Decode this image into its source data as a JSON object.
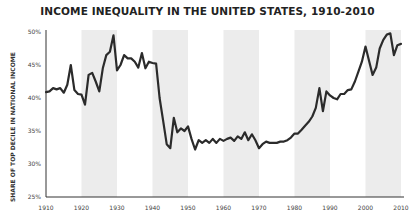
{
  "chart_data": {
    "type": "line",
    "title": "INCOME INEQUALITY IN THE UNITED STATES, 1910-2010",
    "xlabel": "",
    "ylabel": "SHARE OF TOP DECILE IN NATIONAL INCOME",
    "ylim": [
      25,
      50
    ],
    "xlim": [
      1910,
      2010
    ],
    "grid": false,
    "legend": null,
    "y_ticks": [
      "25%",
      "30%",
      "35%",
      "40%",
      "45%",
      "50%"
    ],
    "x_ticks": [
      "1910",
      "1920",
      "1930",
      "1940",
      "1950",
      "1960",
      "1970",
      "1980",
      "1990",
      "2000",
      "2010"
    ],
    "shaded_bands": [
      [
        1920,
        1930
      ],
      [
        1940,
        1950
      ],
      [
        1960,
        1970
      ],
      [
        1980,
        1990
      ],
      [
        2000,
        2010
      ]
    ],
    "series": [
      {
        "name": "Top decile share",
        "color": "#2b2b2b",
        "x": [
          1910,
          1911,
          1912,
          1913,
          1914,
          1915,
          1916,
          1917,
          1918,
          1919,
          1920,
          1921,
          1922,
          1923,
          1924,
          1925,
          1926,
          1927,
          1928,
          1929,
          1930,
          1931,
          1932,
          1933,
          1934,
          1935,
          1936,
          1937,
          1938,
          1939,
          1940,
          1941,
          1942,
          1943,
          1944,
          1945,
          1946,
          1947,
          1948,
          1949,
          1950,
          1951,
          1952,
          1953,
          1954,
          1955,
          1956,
          1957,
          1958,
          1959,
          1960,
          1961,
          1962,
          1963,
          1964,
          1965,
          1966,
          1967,
          1968,
          1969,
          1970,
          1971,
          1972,
          1973,
          1974,
          1975,
          1976,
          1977,
          1978,
          1979,
          1980,
          1981,
          1982,
          1983,
          1984,
          1985,
          1986,
          1987,
          1988,
          1989,
          1990,
          1991,
          1992,
          1993,
          1994,
          1995,
          1996,
          1997,
          1998,
          1999,
          2000,
          2001,
          2002,
          2003,
          2004,
          2005,
          2006,
          2007,
          2008,
          2009,
          2010
        ],
        "values": [
          40.9,
          41.0,
          41.5,
          41.3,
          41.5,
          40.8,
          42.0,
          45.0,
          41.2,
          40.6,
          40.5,
          39.0,
          43.5,
          43.8,
          42.5,
          41.0,
          44.5,
          46.5,
          47.0,
          49.5,
          44.2,
          45.0,
          46.5,
          46.0,
          46.0,
          45.5,
          44.6,
          46.8,
          44.5,
          45.5,
          45.3,
          45.2,
          40.0,
          36.5,
          33.0,
          32.4,
          37.0,
          34.8,
          35.4,
          35.0,
          35.7,
          33.8,
          32.2,
          33.6,
          33.2,
          33.6,
          33.2,
          33.8,
          33.2,
          33.8,
          33.5,
          33.8,
          34.0,
          33.5,
          34.2,
          33.8,
          34.8,
          33.6,
          34.5,
          33.6,
          32.4,
          33.0,
          33.4,
          33.2,
          33.2,
          33.2,
          33.4,
          33.4,
          33.6,
          34.0,
          34.6,
          34.6,
          35.2,
          35.8,
          36.4,
          37.2,
          38.5,
          41.5,
          38.0,
          41.0,
          40.4,
          40.0,
          39.8,
          40.6,
          40.6,
          41.2,
          41.3,
          42.5,
          44.0,
          45.5,
          47.8,
          45.6,
          43.5,
          44.6,
          47.5,
          48.8,
          49.6,
          49.8,
          46.5,
          48.0,
          48.2
        ]
      }
    ]
  },
  "plot": {
    "x0": 46,
    "x1": 401,
    "y_top": 32,
    "y_bottom": 197,
    "axis_x_end": 404,
    "axis_color": "#333333",
    "band_color": "#ececec",
    "line_width": 2.2
  }
}
